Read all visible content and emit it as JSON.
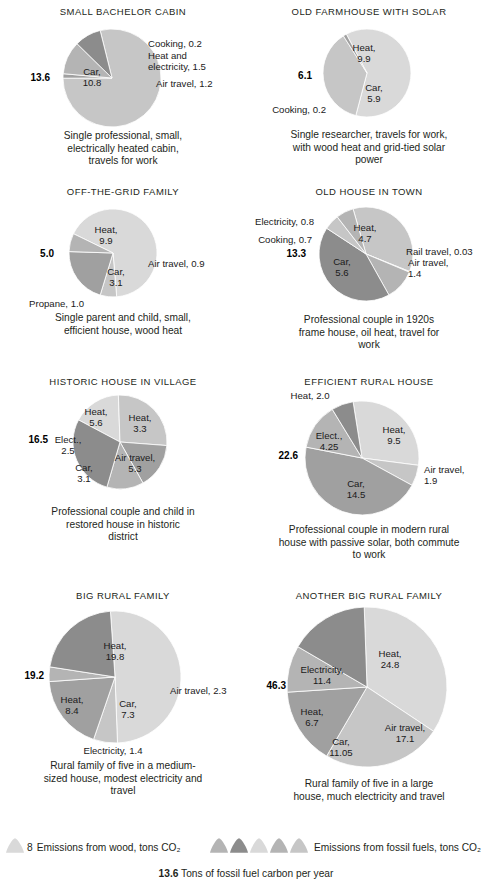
{
  "figure": {
    "palette": {
      "wood": "#d9d9d9",
      "fossil_light": "#c6c6c6",
      "fossil_mid": "#b4b4b4",
      "fossil_dark": "#a0a0a0",
      "fossil_darker": "#8c8c8c",
      "stroke": "#ffffff",
      "text": "#231f20"
    },
    "legend": {
      "wood_value": "8",
      "wood_text": "Emissions from wood, tons CO₂",
      "fossil_text": "Emissions from fossil fuels, tons CO₂",
      "fossil_swatch_count": 5,
      "footer_number": "13.6",
      "footer_text": "Tons of fossil fuel carbon per year"
    }
  },
  "chart_data": [
    {
      "type": "pie",
      "id": "small-bachelor-cabin",
      "title": "SMALL BACHELOR CABIN",
      "total": "13.6",
      "total_value": 13.6,
      "caption": "Single professional, small,\nelectrically heated cabin,\ntravels for work",
      "categories": [
        "Car",
        "Cooking",
        "Heat and electricity",
        "Air travel"
      ],
      "values": [
        10.8,
        0.2,
        1.5,
        1.2
      ],
      "fuel": [
        "fossil",
        "fossil",
        "fossil",
        "fossil"
      ],
      "labels": [
        {
          "text": "Car,\n10.8",
          "value": 10.8
        },
        {
          "text": "Cooking, 0.2",
          "value": 0.2
        },
        {
          "text": "Heat and\nelectricity, 1.5",
          "value": 1.5
        },
        {
          "text": "Air travel, 1.2",
          "value": 1.2
        }
      ]
    },
    {
      "type": "pie",
      "id": "old-farmhouse-with-solar",
      "title": "OLD FARMHOUSE WITH SOLAR",
      "total": "6.1",
      "total_value": 6.1,
      "caption": "Single researcher, travels for work,\nwith wood heat and grid-tied solar\npower",
      "categories": [
        "Heat",
        "Car",
        "Cooking"
      ],
      "values": [
        9.9,
        5.9,
        0.2
      ],
      "fuel": [
        "wood",
        "fossil",
        "fossil"
      ],
      "labels": [
        {
          "text": "Heat,\n9.9",
          "value": 9.9
        },
        {
          "text": "Car,\n5.9",
          "value": 5.9
        },
        {
          "text": "Cooking, 0.2",
          "value": 0.2
        }
      ]
    },
    {
      "type": "pie",
      "id": "off-the-grid-family",
      "title": "OFF-THE-GRID FAMILY",
      "total": "5.0",
      "total_value": 5.0,
      "caption": "Single parent and child, small,\nefficient house, wood heat",
      "categories": [
        "Heat",
        "Air travel",
        "Car",
        "Propane"
      ],
      "values": [
        9.9,
        0.9,
        3.1,
        1.0
      ],
      "fuel": [
        "wood",
        "fossil",
        "fossil",
        "fossil"
      ],
      "labels": [
        {
          "text": "Heat,\n9.9",
          "value": 9.9
        },
        {
          "text": "Air travel, 0.9",
          "value": 0.9
        },
        {
          "text": "Car,\n3.1",
          "value": 3.1
        },
        {
          "text": "Propane, 1.0",
          "value": 1.0
        }
      ]
    },
    {
      "type": "pie",
      "id": "old-house-in-town",
      "title": "OLD HOUSE IN TOWN",
      "total": "13.3",
      "total_value": 13.3,
      "caption": "Professional couple in 1920s\nframe house, oil heat, travel for\nwork",
      "categories": [
        "Heat",
        "Rail travel",
        "Air travel",
        "Car",
        "Cooking",
        "Electricity"
      ],
      "values": [
        4.7,
        0.03,
        1.4,
        5.6,
        0.7,
        0.8
      ],
      "fuel": [
        "fossil",
        "fossil",
        "fossil",
        "fossil",
        "fossil",
        "fossil"
      ],
      "labels": [
        {
          "text": "Heat,\n4.7",
          "value": 4.7
        },
        {
          "text": "Rail travel, 0.03",
          "value": 0.03
        },
        {
          "text": "Air travel,\n1.4",
          "value": 1.4
        },
        {
          "text": "Car,\n5.6",
          "value": 5.6
        },
        {
          "text": "Cooking, 0.7",
          "value": 0.7
        },
        {
          "text": "Electricity, 0.8",
          "value": 0.8
        }
      ]
    },
    {
      "type": "pie",
      "id": "historic-house-in-village",
      "title": "HISTORIC HOUSE IN VILLAGE",
      "total": "16.5",
      "total_value": 16.5,
      "caption": "Professional couple and child in\nrestored house in historic\ndistrict",
      "categories": [
        "Heat (wood)",
        "Air travel",
        "Car",
        "Elect.",
        "Heat (fossil)"
      ],
      "values": [
        3.3,
        5.3,
        3.1,
        2.5,
        5.6
      ],
      "fuel": [
        "wood",
        "fossil",
        "fossil",
        "fossil",
        "fossil"
      ],
      "labels": [
        {
          "text": "Heat,\n3.3",
          "value": 3.3
        },
        {
          "text": "Air travel,\n5.3",
          "value": 5.3
        },
        {
          "text": "Car,\n3.1",
          "value": 3.1
        },
        {
          "text": "Elect.,\n2.5",
          "value": 2.5
        },
        {
          "text": "Heat,\n5.6",
          "value": 5.6
        }
      ]
    },
    {
      "type": "pie",
      "id": "efficient-rural-house",
      "title": "EFFICIENT RURAL HOUSE",
      "total": "22.6",
      "total_value": 22.6,
      "caption": "Professional couple in modern rural\nhouse with passive solar, both commute\nto work",
      "categories": [
        "Heat (wood)",
        "Air travel",
        "Car",
        "Elect.",
        "Heat (fossil)"
      ],
      "values": [
        9.5,
        1.9,
        14.5,
        4.25,
        2.0
      ],
      "fuel": [
        "wood",
        "fossil",
        "fossil",
        "fossil",
        "fossil"
      ],
      "labels": [
        {
          "text": "Heat,\n9.5",
          "value": 9.5
        },
        {
          "text": "Air travel,\n1.9",
          "value": 1.9
        },
        {
          "text": "Car,\n14.5",
          "value": 14.5
        },
        {
          "text": "Elect.,\n4.25",
          "value": 4.25
        },
        {
          "text": "Heat, 2.0",
          "value": 2.0
        }
      ]
    },
    {
      "type": "pie",
      "id": "big-rural-family",
      "title": "BIG RURAL FAMILY",
      "total": "19.2",
      "total_value": 19.2,
      "caption": "Rural family of five in a medium-\nsized house, modest electricity and\ntravel",
      "categories": [
        "Heat (wood)",
        "Air travel",
        "Car",
        "Electricity",
        "Heat (fossil)"
      ],
      "values": [
        19.8,
        2.3,
        7.3,
        1.4,
        8.4
      ],
      "fuel": [
        "wood",
        "fossil",
        "fossil",
        "fossil",
        "fossil"
      ],
      "labels": [
        {
          "text": "Heat,\n19.8",
          "value": 19.8
        },
        {
          "text": "Air travel, 2.3",
          "value": 2.3
        },
        {
          "text": "Car,\n7.3",
          "value": 7.3
        },
        {
          "text": "Electricity, 1.4",
          "value": 1.4
        },
        {
          "text": "Heat,\n8.4",
          "value": 8.4
        }
      ]
    },
    {
      "type": "pie",
      "id": "another-big-rural-family",
      "title": "ANOTHER BIG RURAL FAMILY",
      "total": "46.3",
      "total_value": 46.3,
      "caption": "Rural family of five in a large\nhouse, much electricity and travel",
      "categories": [
        "Heat (wood)",
        "Air travel",
        "Car",
        "Heat (fossil)",
        "Electricity"
      ],
      "values": [
        24.8,
        17.1,
        11.05,
        6.7,
        11.4
      ],
      "fuel": [
        "wood",
        "fossil",
        "fossil",
        "fossil",
        "fossil"
      ],
      "labels": [
        {
          "text": "Heat,\n24.8",
          "value": 24.8
        },
        {
          "text": "Air travel,\n17.1",
          "value": 17.1
        },
        {
          "text": "Car,\n11.05",
          "value": 11.05
        },
        {
          "text": "Heat,\n6.7",
          "value": 6.7
        },
        {
          "text": "Electricity,\n11.4",
          "value": 11.4
        }
      ]
    }
  ]
}
